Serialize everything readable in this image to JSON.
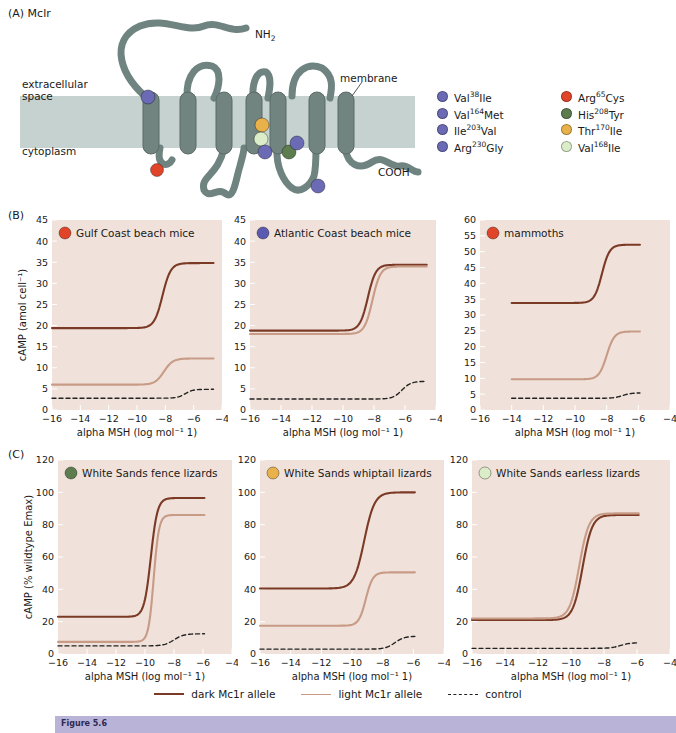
{
  "figure": {
    "panelA": {
      "tag": "(A) Mclr",
      "labels": {
        "extracellular": "extracellular\nspace",
        "membrane": "membrane",
        "cytoplasm": "cytoplasm",
        "n_term": "NH",
        "n_term_sub": "2",
        "c_term": "COOH"
      },
      "legend": [
        {
          "label": "Val<sup>38</sup>Ile",
          "color": "#6a6bb4"
        },
        {
          "label": "Arg<sup>65</sup>Cys",
          "color": "#e0452a"
        },
        {
          "label": "Val<sup>164</sup>Met",
          "color": "#6a6bb4"
        },
        {
          "label": "His<sup>208</sup>Tyr",
          "color": "#5d7d4e"
        },
        {
          "label": "Ile<sup>203</sup>Val",
          "color": "#6a6bb4"
        },
        {
          "label": "Thr<sup>170</sup>Ile",
          "color": "#e8b14a"
        },
        {
          "label": "Arg<sup>230</sup>Gly",
          "color": "#6a6bb4"
        },
        {
          "label": "Val<sup>168</sup>Ile",
          "color": "#dbedc8"
        }
      ]
    },
    "panelB": {
      "tag": "(B)"
    },
    "panelC": {
      "tag": "(C)"
    },
    "bottom_legend": [
      {
        "label": "dark Mc1r allele",
        "style": "dark",
        "color": "#7b3a26"
      },
      {
        "label": "light Mc1r allele",
        "style": "light",
        "color": "#c79b86"
      },
      {
        "label": "control",
        "style": "ctrl",
        "color": "#222222"
      }
    ],
    "caption_bar_text": "Figure 5.6"
  },
  "chart_data": [
    {
      "id": "gulf-coast-beach-mice",
      "type": "line",
      "panel": "B",
      "title": "Gulf Coast beach mice",
      "marker_color": "#e0452a",
      "xlabel": "alpha MSH (log mol⁻¹ 1)",
      "ylabel": "cAMP (amol cell⁻¹)",
      "xlim": [
        -16,
        -4
      ],
      "ylim": [
        0,
        45
      ],
      "xticks": [
        -16,
        -14,
        -12,
        -10,
        -8,
        -6,
        -4
      ],
      "yticks": [
        0,
        5,
        10,
        15,
        20,
        25,
        30,
        35,
        40,
        45
      ],
      "grid": false,
      "series": [
        {
          "name": "dark Mc1r allele",
          "color": "#7b3a26",
          "bottom": 19.4,
          "top": 34.8,
          "ec50": -8.2,
          "hill": 1.5,
          "xstart": -16,
          "xend": -4.6
        },
        {
          "name": "light Mc1r allele",
          "color": "#c79b86",
          "bottom": 6.0,
          "top": 12.2,
          "ec50": -8.1,
          "hill": 1.4,
          "xstart": -16,
          "xend": -4.6
        },
        {
          "name": "control",
          "color": "#222222",
          "bottom": 2.8,
          "top": 4.9,
          "ec50": -6.6,
          "hill": 1.6,
          "xstart": -16,
          "xend": -4.6,
          "dashed": true
        }
      ]
    },
    {
      "id": "atlantic-coast-beach-mice",
      "type": "line",
      "panel": "B",
      "title": "Atlantic Coast beach mice",
      "marker_color": "#5a5ab0",
      "xlabel": "alpha MSH (log mol⁻¹ 1)",
      "ylabel": "",
      "xlim": [
        -16,
        -4
      ],
      "ylim": [
        0,
        45
      ],
      "xticks": [
        -16,
        -14,
        -12,
        -10,
        -8,
        -6,
        -4
      ],
      "yticks": [
        0,
        5,
        10,
        15,
        20,
        25,
        30,
        35,
        40,
        45
      ],
      "grid": false,
      "series": [
        {
          "name": "dark Mc1r allele",
          "color": "#7b3a26",
          "bottom": 18.8,
          "top": 34.4,
          "ec50": -8.4,
          "hill": 1.7,
          "xstart": -16,
          "xend": -4.6
        },
        {
          "name": "light Mc1r allele",
          "color": "#c79b86",
          "bottom": 18.0,
          "top": 34.0,
          "ec50": -8.1,
          "hill": 1.7,
          "xstart": -16,
          "xend": -4.6
        },
        {
          "name": "control",
          "color": "#222222",
          "bottom": 2.6,
          "top": 6.8,
          "ec50": -6.2,
          "hill": 1.5,
          "xstart": -16,
          "xend": -4.6,
          "dashed": true
        }
      ]
    },
    {
      "id": "mammoths",
      "type": "line",
      "panel": "B",
      "title": "mammoths",
      "marker_color": "#e0452a",
      "xlabel": "alpha MSH (log mol⁻¹ 1)",
      "ylabel": "",
      "xlim": [
        -16,
        -4
      ],
      "ylim": [
        0,
        60
      ],
      "xticks": [
        -16,
        -14,
        -12,
        -10,
        -8,
        -6,
        -4
      ],
      "yticks": [
        0,
        5,
        10,
        15,
        20,
        25,
        30,
        35,
        40,
        45,
        50,
        55,
        60
      ],
      "grid": false,
      "series": [
        {
          "name": "dark Mc1r allele",
          "color": "#7b3a26",
          "bottom": 33.8,
          "top": 52.2,
          "ec50": -8.3,
          "hill": 1.8,
          "xstart": -14,
          "xend": -5.9
        },
        {
          "name": "light Mc1r allele",
          "color": "#c79b86",
          "bottom": 9.7,
          "top": 24.8,
          "ec50": -8.0,
          "hill": 1.8,
          "xstart": -14,
          "xend": -5.9
        },
        {
          "name": "control",
          "color": "#222222",
          "bottom": 3.7,
          "top": 5.4,
          "ec50": -7.0,
          "hill": 1.6,
          "xstart": -14,
          "xend": -5.9,
          "dashed": true
        }
      ]
    },
    {
      "id": "white-sands-fence-lizards",
      "type": "line",
      "panel": "C",
      "title": "White Sands fence lizards",
      "marker_color": "#5d7d4e",
      "xlabel": "alpha MSH (log mol⁻¹ 1)",
      "ylabel": "cAMP (% wildtype Emax)",
      "xlim": [
        -16,
        -4
      ],
      "ylim": [
        0,
        120
      ],
      "xticks": [
        -16,
        -14,
        -12,
        -10,
        -8,
        -6,
        -4
      ],
      "yticks": [
        0,
        20,
        40,
        60,
        80,
        100,
        120
      ],
      "grid": false,
      "series": [
        {
          "name": "dark Mc1r allele",
          "color": "#7b3a26",
          "bottom": 23.0,
          "top": 96.5,
          "ec50": -9.6,
          "hill": 1.9,
          "xstart": -16,
          "xend": -5.9
        },
        {
          "name": "light Mc1r allele",
          "color": "#c79b86",
          "bottom": 7.5,
          "top": 86.0,
          "ec50": -9.4,
          "hill": 2.4,
          "xstart": -16,
          "xend": -5.9
        },
        {
          "name": "control",
          "color": "#222222",
          "bottom": 5.0,
          "top": 12.5,
          "ec50": -8.0,
          "hill": 1.3,
          "xstart": -16,
          "xend": -5.9,
          "dashed": true
        }
      ]
    },
    {
      "id": "white-sands-whiptail-lizards",
      "type": "line",
      "panel": "C",
      "title": "White Sands whiptail lizards",
      "marker_color": "#e8b14a",
      "xlabel": "alpha MSH (log mol⁻¹ 1)",
      "ylabel": "",
      "xlim": [
        -16,
        -4
      ],
      "ylim": [
        0,
        120
      ],
      "xticks": [
        -16,
        -14,
        -12,
        -10,
        -8,
        -6,
        -4
      ],
      "yticks": [
        0,
        20,
        40,
        60,
        80,
        100,
        120
      ],
      "grid": false,
      "series": [
        {
          "name": "dark Mc1r allele",
          "color": "#7b3a26",
          "bottom": 40.5,
          "top": 100.0,
          "ec50": -9.2,
          "hill": 1.3,
          "xstart": -16,
          "xend": -5.9
        },
        {
          "name": "light Mc1r allele",
          "color": "#c79b86",
          "bottom": 17.5,
          "top": 50.5,
          "ec50": -9.1,
          "hill": 1.9,
          "xstart": -16,
          "xend": -5.9
        },
        {
          "name": "control",
          "color": "#222222",
          "bottom": 3.0,
          "top": 11.0,
          "ec50": -7.2,
          "hill": 1.4,
          "xstart": -16,
          "xend": -5.9,
          "dashed": true
        }
      ]
    },
    {
      "id": "white-sands-earless-lizards",
      "type": "line",
      "panel": "C",
      "title": "White Sands earless lizards",
      "marker_color": "#dbedc8",
      "xlabel": "alpha MSH (log mol⁻¹ 1)",
      "ylabel": "",
      "xlim": [
        -16,
        -4
      ],
      "ylim": [
        0,
        120
      ],
      "xticks": [
        -16,
        -14,
        -12,
        -10,
        -8,
        -6,
        -4
      ],
      "yticks": [
        0,
        20,
        40,
        60,
        80,
        100,
        120
      ],
      "grid": false,
      "series": [
        {
          "name": "dark Mc1r allele",
          "color": "#7b3a26",
          "bottom": 21.0,
          "top": 86.0,
          "ec50": -9.3,
          "hill": 1.5,
          "xstart": -16,
          "xend": -5.9
        },
        {
          "name": "light Mc1r allele",
          "color": "#c79b86",
          "bottom": 22.0,
          "top": 87.0,
          "ec50": -9.5,
          "hill": 1.5,
          "xstart": -16,
          "xend": -5.9
        },
        {
          "name": "control",
          "color": "#222222",
          "bottom": 3.5,
          "top": 7.0,
          "ec50": -7.0,
          "hill": 1.5,
          "xstart": -16,
          "xend": -5.9,
          "dashed": true
        }
      ]
    }
  ]
}
